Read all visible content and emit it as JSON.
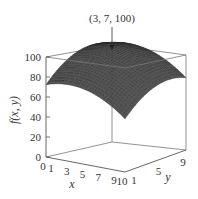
{
  "chart_data": {
    "type": "surface3d",
    "title": "",
    "function_label": "f(x, y)",
    "xlabel": "x",
    "ylabel": "y",
    "zlabel": "f(x, y)",
    "x_ticks": [
      0,
      1,
      3,
      5,
      7,
      9,
      10
    ],
    "y_ticks": [
      1,
      5,
      9
    ],
    "z_ticks": [
      0,
      20,
      40,
      60,
      80,
      100
    ],
    "xlim": [
      0,
      10
    ],
    "ylim": [
      0,
      10
    ],
    "zlim": [
      0,
      100
    ],
    "maximum": {
      "x": 3,
      "y": 7,
      "z": 100
    },
    "annotation": "(3, 7, 100)",
    "corner_values": {
      "x0_y0": 42,
      "x10_y0": 0,
      "x10_y10": 52,
      "x0_y10": 84
    },
    "surface_color": "#555555",
    "mesh_color": "#222222",
    "box_color": "#666666"
  }
}
